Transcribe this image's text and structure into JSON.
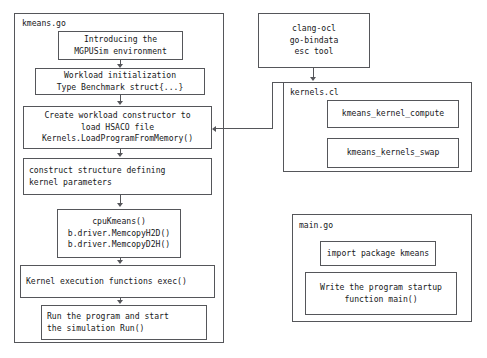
{
  "diagram": {
    "stroke_color": "#55565a",
    "text_color": "#17181a",
    "background": "#ffffff"
  },
  "groups": {
    "kmeans_go": {
      "label": "kmeans.go"
    },
    "kernels_cl": {
      "label": "kernels.cl"
    },
    "main_go": {
      "label": "main.go"
    }
  },
  "nodes": {
    "introducing": {
      "line1": "Introducing the",
      "line2": "MGPUSim environment"
    },
    "workload_init": {
      "line1": "Workload initialization",
      "line2": "Type Benchmark struct{...}"
    },
    "create_constructor": {
      "line1": "Create workload constructor to",
      "line2": "load HSACO file",
      "line3": "Kernels.LoadProgramFromMemory()"
    },
    "construct_structure": {
      "line1": "construct structure defining",
      "line2": "kernel parameters"
    },
    "cpu_kmeans": {
      "line1": "cpuKmeans()",
      "line2": "b.driver.MemcopyH2D()",
      "line3": "b.driver.MemcopyD2H()"
    },
    "kernel_exec": {
      "line1": "Kernel execution functions exec()"
    },
    "run_program": {
      "line1": "Run the program and start",
      "line2": "the simulation Run()"
    },
    "toolchain": {
      "line1": "clang-ocl",
      "line2": "go-bindata",
      "line3": "esc tool"
    },
    "kernel_compute": {
      "line1": "kmeans_kernel_compute"
    },
    "kernels_swap": {
      "line1": "kmeans_kernels_swap"
    },
    "import_package": {
      "line1": "import package kmeans"
    },
    "write_main": {
      "line1": "Write the program startup",
      "line2": "function main()"
    }
  }
}
